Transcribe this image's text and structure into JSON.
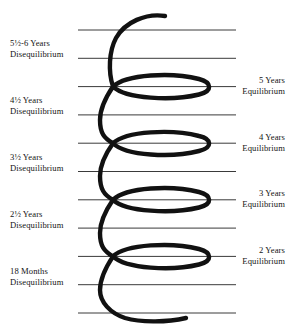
{
  "diagram": {
    "type": "spiral-helix",
    "line_color": "#3a3a3a",
    "spiral_color": "#111111",
    "background_color": "#ffffff",
    "guide_line_count": 11,
    "guide_line_x_start": 78,
    "guide_line_x_end": 236,
    "guide_line_y_positions": [
      30,
      58.3,
      86.6,
      114.9,
      143.2,
      171.5,
      199.8,
      228.1,
      256.4,
      284.7,
      313
    ],
    "spiral_crossing_x": 113,
    "spiral_left_extent": 99,
    "spiral_right_extent": 213,
    "spiral_top_end": {
      "x": 165,
      "y": 16
    },
    "spiral_bottom_end": {
      "x": 186,
      "y": 318
    }
  },
  "left_labels": [
    {
      "line1": "5½-6 Years",
      "line2": "Disequilibrium",
      "top": 38
    },
    {
      "line1": "4½ Years",
      "line2": "Disequilibrium",
      "top": 95
    },
    {
      "line1": "3½ Years",
      "line2": "Disequilibrium",
      "top": 152
    },
    {
      "line1": "2½ Years",
      "line2": "Disequilibrium",
      "top": 209
    },
    {
      "line1": "18 Months",
      "line2": "Disequilibrium",
      "top": 266
    }
  ],
  "right_labels": [
    {
      "line1": "5 Years",
      "line2": "Equilibrium",
      "top": 75
    },
    {
      "line1": "4 Years",
      "line2": "Equilibrium",
      "top": 132
    },
    {
      "line1": "3 Years",
      "line2": "Equilibrium",
      "top": 188
    },
    {
      "line1": "2 Years",
      "line2": "Equilibrium",
      "top": 245
    }
  ]
}
